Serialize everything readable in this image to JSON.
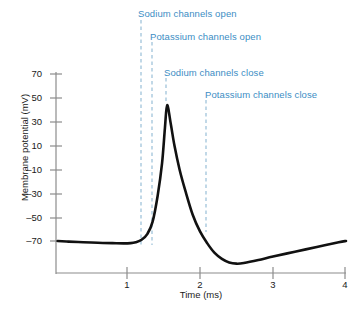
{
  "chart_data": {
    "type": "line",
    "title": "",
    "subtitle": "",
    "xlabel": "Time (ms)",
    "ylabel": "Membrane potential (mV)",
    "xlim": [
      0.03,
      4.0
    ],
    "ylim": [
      -95,
      75
    ],
    "grid": false,
    "legend_position": "none",
    "xticks": [
      1,
      2,
      3,
      4
    ],
    "xtick_labels": [
      "1",
      "2",
      "3",
      "4"
    ],
    "yticks": [
      70,
      50,
      30,
      10,
      -10,
      -30,
      -50,
      -70
    ],
    "ytick_labels": [
      "70",
      "50",
      "30",
      "10",
      "–10",
      "–30",
      "–50",
      "–70"
    ],
    "line_color": "#111111",
    "annotation_color": "#3c8dc4",
    "series": [
      {
        "name": "Action potential",
        "x": [
          0.05,
          0.2,
          0.4,
          0.6,
          0.8,
          0.95,
          1.05,
          1.12,
          1.2,
          1.28,
          1.35,
          1.42,
          1.48,
          1.52,
          1.55,
          1.6,
          1.65,
          1.72,
          1.8,
          1.9,
          2.0,
          2.1,
          2.2,
          2.3,
          2.4,
          2.5,
          2.6,
          2.8,
          3.0,
          3.3,
          3.6,
          3.9,
          4.0
        ],
        "y": [
          -70,
          -70.5,
          -71,
          -71.5,
          -71.8,
          -72,
          -71.8,
          -71,
          -69,
          -64,
          -54,
          -32,
          -5,
          25,
          44,
          28,
          10,
          -10,
          -28,
          -48,
          -62,
          -72,
          -80,
          -85,
          -88,
          -89,
          -88.5,
          -86,
          -83,
          -79,
          -75,
          -71,
          -70
        ]
      }
    ],
    "annotations": [
      {
        "id": "sodium-channels-open",
        "text": "Sodium channels open",
        "x_ms": 1.18,
        "label_x": 138,
        "label_y": 8,
        "line_top": 20,
        "line_bottom": 245
      },
      {
        "id": "potassium-channels-open",
        "text": "Potassium channels open",
        "x_ms": 1.33,
        "label_x": 150,
        "label_y": 31,
        "line_top": 42,
        "line_bottom": 245
      },
      {
        "id": "sodium-channels-close",
        "text": "Sodium channels close",
        "x_ms": 1.52,
        "label_x": 164,
        "label_y": 67,
        "line_top": 78,
        "line_bottom": 102
      },
      {
        "id": "potassium-channels-close",
        "text": "Potassium channels close",
        "x_ms": 2.07,
        "label_x": 205,
        "label_y": 89,
        "line_top": 100,
        "line_bottom": 232
      }
    ]
  },
  "axes": {
    "y_axis_label": "Membrane potential (mV)",
    "x_axis_label": "Time (ms)",
    "y_tick_labels": [
      "70",
      "50",
      "30",
      "10",
      "–10",
      "–30",
      "–50",
      "–70"
    ],
    "x_tick_labels": [
      "1",
      "2",
      "3",
      "4"
    ]
  }
}
